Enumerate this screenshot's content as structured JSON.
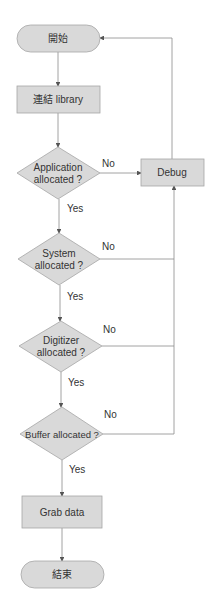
{
  "diagram": {
    "type": "flowchart",
    "colors": {
      "node_fill": "#d9d9d9",
      "node_stroke": "#a6a6a6",
      "line": "#7f7f7f",
      "text": "#333333"
    },
    "nodes": [
      {
        "id": "start",
        "shape": "terminator",
        "label": "開始"
      },
      {
        "id": "link",
        "shape": "process",
        "label": "連結 library"
      },
      {
        "id": "app",
        "shape": "decision",
        "label_line1": "Application",
        "label_line2": "allocated ?"
      },
      {
        "id": "sys",
        "shape": "decision",
        "label_line1": "System",
        "label_line2": "allocated ?"
      },
      {
        "id": "dig",
        "shape": "decision",
        "label_line1": "Digitizer",
        "label_line2": "allocated ?"
      },
      {
        "id": "buf",
        "shape": "decision",
        "label": "Buffer allocated ?"
      },
      {
        "id": "grab",
        "shape": "process",
        "label": "Grab data"
      },
      {
        "id": "end",
        "shape": "terminator",
        "label": "結束"
      },
      {
        "id": "debug",
        "shape": "process",
        "label": "Debug"
      }
    ],
    "edges": [
      {
        "from": "start",
        "to": "link"
      },
      {
        "from": "link",
        "to": "app"
      },
      {
        "from": "app",
        "to": "sys",
        "label": "Yes"
      },
      {
        "from": "app",
        "to": "debug",
        "label": "No"
      },
      {
        "from": "sys",
        "to": "dig",
        "label": "Yes"
      },
      {
        "from": "sys",
        "to": "debug",
        "label": "No"
      },
      {
        "from": "dig",
        "to": "buf",
        "label": "Yes"
      },
      {
        "from": "dig",
        "to": "debug",
        "label": "No"
      },
      {
        "from": "buf",
        "to": "grab",
        "label": "Yes"
      },
      {
        "from": "buf",
        "to": "debug",
        "label": "No"
      },
      {
        "from": "grab",
        "to": "end"
      },
      {
        "from": "debug",
        "to": "start"
      }
    ]
  }
}
